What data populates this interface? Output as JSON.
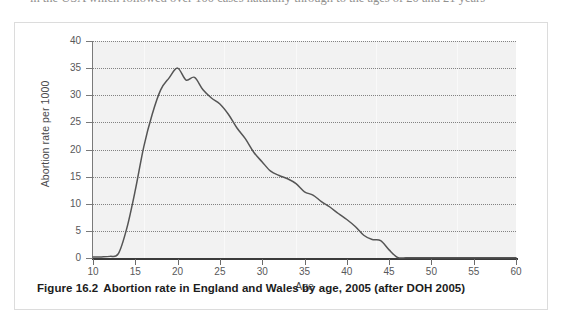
{
  "page": {
    "top_cut_text": "in the USA which followed over 100 cases naturally through to the ages of 20 and 21 years"
  },
  "figure": {
    "number": "Figure 16.2",
    "caption": "Abortion rate in England and Wales by age, 2005 (after DOH 2005)"
  },
  "colors": {
    "plot_background": "#f2f2f2",
    "line": "#555555",
    "grid": "#6f6f6f",
    "axis": "#3b3b3b",
    "tick_label": "#58585a",
    "figure_border": "#dcdcdc"
  },
  "chart_data": {
    "type": "line",
    "title": "",
    "xlabel": "Age",
    "ylabel": "Abortion rate per 1000",
    "xlim": [
      10,
      60
    ],
    "ylim": [
      0,
      40
    ],
    "xticks": [
      10,
      15,
      20,
      25,
      30,
      35,
      40,
      45,
      50,
      55,
      60
    ],
    "yticks": [
      0,
      5,
      10,
      15,
      20,
      25,
      30,
      35,
      40
    ],
    "grid": "horizontal-dotted",
    "legend": "none",
    "series": [
      {
        "name": "Abortion rate per 1000 women",
        "x": [
          10,
          11,
          12,
          13,
          14,
          15,
          16,
          17,
          18,
          19,
          20,
          21,
          22,
          23,
          24,
          25,
          26,
          27,
          28,
          29,
          30,
          31,
          32,
          33,
          34,
          35,
          36,
          37,
          38,
          39,
          40,
          41,
          42,
          43,
          44,
          45,
          46,
          47,
          48,
          50,
          52,
          55,
          57,
          60
        ],
        "values": [
          0.2,
          0.2,
          0.3,
          0.8,
          5.5,
          12.5,
          20.5,
          26.5,
          31.0,
          33.2,
          35.0,
          32.8,
          33.3,
          31.0,
          29.5,
          28.4,
          26.5,
          24.0,
          22.0,
          19.5,
          17.7,
          16.0,
          15.2,
          14.6,
          13.7,
          12.2,
          11.6,
          10.4,
          9.4,
          8.2,
          7.1,
          5.8,
          4.2,
          3.4,
          3.2,
          1.5,
          0.1,
          0.05,
          0.05,
          0.05,
          0.05,
          0.05,
          0.05,
          0.05
        ]
      }
    ],
    "peak": {
      "x": 20,
      "y": 35
    },
    "secondary_peak": {
      "x": 22,
      "y": 33.3
    },
    "zero_tail_from": 46
  }
}
